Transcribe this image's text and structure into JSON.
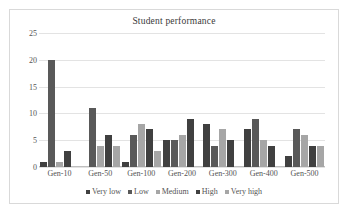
{
  "chart_data": {
    "type": "bar",
    "title": "Student performance",
    "xlabel": "",
    "ylabel": "",
    "ylim": [
      0,
      25
    ],
    "yticks": [
      0,
      5,
      10,
      15,
      20,
      25
    ],
    "grid": true,
    "legend_position": "bottom",
    "categories": [
      "Gen-10",
      "Gen-50",
      "Gen-100",
      "Gen-200",
      "Gen-300",
      "Gen-400",
      "Gen-500"
    ],
    "series": [
      {
        "name": "Very low",
        "color": "#404040",
        "values": [
          1,
          0,
          1,
          5,
          8,
          7,
          2
        ]
      },
      {
        "name": "Low",
        "color": "#595959",
        "values": [
          20,
          11,
          6,
          5,
          4,
          9,
          7
        ]
      },
      {
        "name": "Medium",
        "color": "#a6a6a6",
        "values": [
          1,
          4,
          8,
          6,
          7,
          5,
          6
        ]
      },
      {
        "name": "High",
        "color": "#404040",
        "values": [
          3,
          6,
          7,
          9,
          5,
          4,
          4
        ]
      },
      {
        "name": "Very high",
        "color": "#a6a6a6",
        "values": [
          0,
          4,
          3,
          0,
          0,
          0,
          4
        ]
      }
    ]
  }
}
